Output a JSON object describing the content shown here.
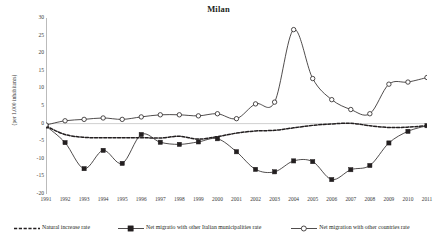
{
  "chart_data": {
    "type": "line",
    "title": "Milan",
    "xlabel": "",
    "ylabel": "(per 1,000 inhabitants)",
    "x": [
      1991,
      1992,
      1993,
      1994,
      1995,
      1996,
      1997,
      1998,
      1999,
      2000,
      2001,
      2002,
      2003,
      2004,
      2005,
      2006,
      2007,
      2008,
      2009,
      2010,
      2011
    ],
    "categories": [
      "1991",
      "1992",
      "1993",
      "1994",
      "1995",
      "1996",
      "1997",
      "1998",
      "1999",
      "2000",
      "2001",
      "2002",
      "2003",
      "2004",
      "2005",
      "2006",
      "2007",
      "2008",
      "2009",
      "2010",
      "2011"
    ],
    "xlim": [
      1991,
      2011
    ],
    "ylim": [
      -20,
      30
    ],
    "yticks": [
      30,
      25,
      20,
      15,
      10,
      5,
      0,
      -5,
      -10,
      -15,
      -20
    ],
    "grid": false,
    "legend_position": "bottom",
    "series": [
      {
        "name": "Natural increase rate",
        "marker": "none",
        "style": "dashed",
        "color": "#231f20",
        "values": [
          -0.7,
          -3.1,
          -3.9,
          -4.0,
          -4.0,
          -4.0,
          -4.1,
          -3.6,
          -4.4,
          -3.7,
          -2.7,
          -2.1,
          -1.9,
          -1.2,
          -0.5,
          -0.1,
          0.1,
          -0.6,
          -1.1,
          -1.0,
          -0.6
        ]
      },
      {
        "name": "Net migratio with other Italian municipalities rate",
        "marker": "filled-square",
        "style": "solid",
        "color": "#231f20",
        "values": [
          -0.7,
          -5.4,
          -12.8,
          -7.6,
          -11.3,
          -3.1,
          -5.3,
          -5.9,
          -5.2,
          -4.3,
          -8.0,
          -13.0,
          -13.7,
          -10.6,
          -10.8,
          -15.9,
          -13.1,
          -11.9,
          -5.5,
          -2.2,
          -0.6
        ]
      },
      {
        "name": "Net migration with other countries rate",
        "marker": "open-circle",
        "style": "solid",
        "color": "#231f20",
        "values": [
          -0.4,
          0.8,
          1.2,
          1.6,
          1.2,
          1.9,
          2.5,
          2.5,
          2.2,
          2.8,
          1.4,
          5.6,
          6.1,
          26.7,
          12.8,
          6.8,
          4.0,
          2.8,
          11.2,
          11.8,
          13.1
        ]
      }
    ]
  },
  "legend": {
    "items": [
      {
        "label": "Natural increase rate",
        "marker": "dashed-line"
      },
      {
        "label": "Net migratio with other Italian municipalities rate",
        "marker": "line-filled-square"
      },
      {
        "label": "Net migration with other countries rate",
        "marker": "line-open-circle"
      }
    ]
  }
}
